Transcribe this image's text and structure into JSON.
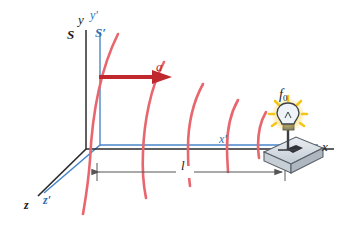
{
  "figure": {
    "type": "physics-diagram",
    "width": 343,
    "height": 236,
    "background": "#ffffff"
  },
  "colors": {
    "unprimed_axis": "#2b2b2b",
    "primed_axis": "#4a86c8",
    "wavefront": "#e8666e",
    "acceleration_arrow": "#c0282d",
    "dimension_line": "#555555",
    "bulb_glow": "#f5c518",
    "bulb_glass": "#eef3f8",
    "base_fill": "#d7dde3",
    "label_black": "#1a1a1a",
    "label_blue": "#2f6fb5",
    "label_red": "#c0282d"
  },
  "labels": {
    "y_axis": "y",
    "y_axis_primed": "y′",
    "frame_unprimed": "S",
    "frame_primed": "S′",
    "z_axis": "z",
    "z_axis_primed": "z′",
    "x_axis": "x",
    "x_axis_primed": "x′",
    "acceleration": "a",
    "length": "l",
    "frequency": "f",
    "frequency_subscript": "0"
  },
  "axes": {
    "unprimed": {
      "origin": [
        95,
        148
      ],
      "y_tip": [
        95,
        30
      ],
      "x_tip": [
        336,
        148
      ],
      "z_tip": [
        36,
        198
      ]
    },
    "primed": {
      "origin": [
        100,
        145
      ],
      "y_tip": [
        100,
        32
      ],
      "x_tip": [
        320,
        145
      ],
      "z_tip": [
        42,
        194
      ]
    }
  },
  "wavefronts": {
    "count": 5,
    "description": "Red circular-arc wavefronts, radius decreasing toward the source, bowing to the right",
    "arcs": [
      {
        "index": 1,
        "x_at_axis": 105,
        "top": [
          118,
          34
        ],
        "bottom": [
          83,
          214
        ]
      },
      {
        "index": 2,
        "x_at_axis": 155,
        "top": [
          164,
          62
        ],
        "bottom": [
          146,
          198
        ]
      },
      {
        "index": 3,
        "x_at_axis": 196,
        "top": [
          203,
          84
        ],
        "bottom": [
          190,
          186
        ]
      },
      {
        "index": 4,
        "x_at_axis": 233,
        "top": [
          238,
          100
        ],
        "bottom": [
          228,
          172
        ]
      },
      {
        "index": 5,
        "x_at_axis": 263,
        "top": [
          266,
          112
        ],
        "bottom": [
          259,
          158
        ]
      }
    ]
  },
  "acceleration_vector": {
    "label": "a",
    "from": [
      100,
      77
    ],
    "to": [
      168,
      77
    ],
    "direction": "right"
  },
  "dimension": {
    "label": "l",
    "from": [
      96,
      172
    ],
    "to": [
      285,
      172
    ],
    "style": "double-headed-arrow"
  },
  "source": {
    "name": "light-bulb",
    "frequency_label": "f₀",
    "position": [
      288,
      125
    ],
    "glow": true,
    "ray_count": 8,
    "base": {
      "shape": "parallelogram-platform",
      "center": [
        288,
        155
      ]
    }
  }
}
